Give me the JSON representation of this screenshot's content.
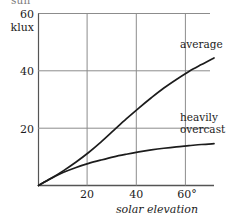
{
  "figure": {
    "clipped_top_text": "sun",
    "background_color": "#ffffff",
    "ink_color": "#1c1c1c",
    "grid_color": "#8c8c8c"
  },
  "chart_data": {
    "type": "line",
    "title": "",
    "subtitle": "",
    "xlabel": "solar elevation",
    "ylabel": "klux",
    "x_unit": "°",
    "xlim": [
      0,
      70
    ],
    "ylim": [
      0,
      60
    ],
    "xticks": [
      20,
      40,
      60
    ],
    "xtick_labels": [
      "20",
      "40",
      "60°"
    ],
    "yticks": [
      20,
      40,
      60
    ],
    "ytick_labels": [
      "20",
      "40",
      "60"
    ],
    "grid": true,
    "grid_vertical": true,
    "grid_horizontal": true,
    "legend": "inline-annotations",
    "legend_position": "right-of-curves",
    "series": [
      {
        "name": "average",
        "label": "average",
        "label_lines": [
          "average"
        ],
        "color": "#1c1c1c",
        "x": [
          0,
          5,
          10,
          15,
          20,
          25,
          30,
          35,
          40,
          45,
          50,
          55,
          60,
          65,
          70
        ],
        "y": [
          0,
          2.5,
          5.2,
          8.2,
          11.5,
          15.2,
          19.2,
          23.2,
          27.0,
          30.6,
          34.0,
          37.0,
          39.8,
          42.2,
          44.5
        ]
      },
      {
        "name": "heavily overcast",
        "label": "heavily overcast",
        "label_lines": [
          "heavily",
          "overcast"
        ],
        "color": "#1c1c1c",
        "x": [
          0,
          5,
          10,
          15,
          20,
          25,
          30,
          35,
          40,
          45,
          50,
          55,
          60,
          65,
          70
        ],
        "y": [
          0,
          2.4,
          4.6,
          6.3,
          7.7,
          8.9,
          10.0,
          10.9,
          11.7,
          12.4,
          13.0,
          13.5,
          13.9,
          14.3,
          14.6
        ]
      }
    ],
    "annotations": [
      {
        "text": "average",
        "x": 62,
        "y": 52
      },
      {
        "text": "heavily",
        "x": 62,
        "y": 24
      },
      {
        "text": "overcast",
        "x": 62,
        "y": 20
      }
    ]
  },
  "labels": {
    "y_unit": "klux",
    "y_top": "60",
    "y_mid": "40",
    "y_low": "20",
    "x_tick_1": "20",
    "x_tick_2": "40",
    "x_tick_3": "60°",
    "x_title": "solar elevation",
    "series_average": "average",
    "series_overcast_line1": "heavily",
    "series_overcast_line2": "overcast"
  }
}
